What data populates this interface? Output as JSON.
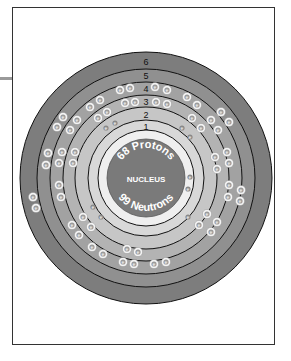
{
  "diagram": {
    "nucleus": {
      "label": "NUCLEUS",
      "protons_label": "68 Protons",
      "neutrons_label": "99 Neutrons",
      "color": "#7a7a7a"
    },
    "shells": [
      {
        "number": "1",
        "electrons": 2
      },
      {
        "number": "2",
        "electrons": 8
      },
      {
        "number": "3",
        "electrons": 18
      },
      {
        "number": "4",
        "electrons": 30
      },
      {
        "number": "5",
        "electrons": 8
      },
      {
        "number": "6",
        "electrons": 2
      }
    ],
    "electron_label": "e",
    "colors": {
      "frame_border": "#333333",
      "ring_inner_white": "#eeeeee",
      "ring_1": "#d8d8d8",
      "ring_2": "#c6c6c6",
      "ring_3": "#b3b3b3",
      "ring_4": "#a2a2a2",
      "ring_5": "#909090",
      "ring_6": "#7d7d7d",
      "nucleus": "#7a7a7a"
    }
  }
}
